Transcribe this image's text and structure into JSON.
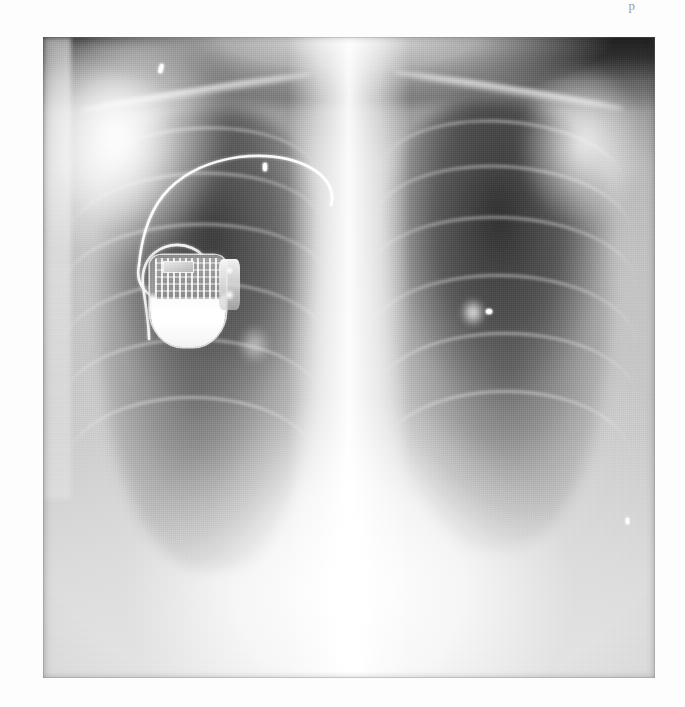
{
  "page": {
    "background_color": "#fdfdfd",
    "running_head": "p",
    "folio": "",
    "caption": ""
  },
  "radiograph": {
    "modality": "X-ray",
    "body_region": "chest",
    "projection": "PA (posteroanterior)",
    "orientation_note": "viewer-left = patient right",
    "plate": {
      "left_px": 43,
      "top_px": 37,
      "width_px": 612,
      "height_px": 641,
      "base_tone": "#8d8d8d",
      "darkest_tone": "#222222",
      "brightest_tone": "#ffffff"
    },
    "findings": [
      "Implanted cardiac pacemaker generator in the right infraclavicular region",
      "Single pacing lead with a redundant loop coursing superomedially",
      "Bilateral lung fields with visible rib and clavicle shadows",
      "Central mediastinum and thoracic spine appear radiodense (white)",
      "Both hemidiaphragms and costophrenic angles are visible"
    ],
    "structures": [
      {
        "name": "right-lung-field",
        "label": "Right lung field"
      },
      {
        "name": "left-lung-field",
        "label": "Left lung field"
      },
      {
        "name": "mediastinum",
        "label": "Mediastinum"
      },
      {
        "name": "thoracic-spine",
        "label": "Thoracic spine"
      },
      {
        "name": "right-clavicle",
        "label": "Right clavicle"
      },
      {
        "name": "left-clavicle",
        "label": "Left clavicle"
      },
      {
        "name": "right-hemidiaphragm",
        "label": "Right hemidiaphragm"
      },
      {
        "name": "left-hemidiaphragm",
        "label": "Left hemidiaphragm"
      },
      {
        "name": "cardiac-silhouette",
        "label": "Cardiac silhouette"
      },
      {
        "name": "left-hilum",
        "label": "Left hilum"
      },
      {
        "name": "right-hilum",
        "label": "Right hilum"
      }
    ],
    "device": {
      "name": "cardiac-pacemaker",
      "label": "Cardiac pacemaker",
      "generator": {
        "label": "Pulse generator (can)",
        "position": "right infraclavicular / upper chest",
        "components": [
          "circuit board",
          "hybrid chip",
          "battery cell",
          "connector header",
          "set screws"
        ]
      },
      "lead": {
        "label": "Endocardial pacing lead",
        "count": 1,
        "feature": "redundant loop in the upper chest",
        "course": "from generator header superiorly, loops, then passes medially toward the subclavian vein"
      }
    },
    "markers": [
      {
        "name": "marker-apex",
        "label": "radiopaque marker, right apex"
      },
      {
        "name": "marker-hilar",
        "label": "radiopaque marker, upper mediastinum"
      },
      {
        "name": "marker-mid",
        "label": "radiopaque density, left hilum"
      },
      {
        "name": "marker-lower",
        "label": "radiopaque marker, left lower zone"
      }
    ]
  }
}
